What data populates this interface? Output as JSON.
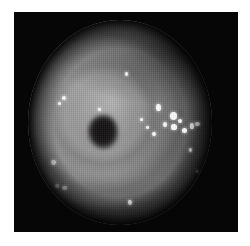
{
  "image": {
    "kind": "endoscopy-photograph",
    "modality_label": "",
    "caption": "",
    "page_background": "#ffffff",
    "frame": {
      "background": "#060606",
      "x": 14,
      "y": 12,
      "width": 224,
      "height": 220
    },
    "field_of_view": {
      "shape": "circle",
      "x": 28,
      "y": 20,
      "width": 184,
      "height": 205,
      "rim_color": "#0a0a0a"
    },
    "tissue": {
      "palette": {
        "highlight": "#b2b2b2",
        "bright": "#a3a3a3",
        "mid": "#8a8a8a",
        "shadow": "#565656",
        "deep_shadow": "#1d1d1d",
        "lumen": "#151313",
        "specular": "#fbfbfb"
      },
      "fold_count": 4,
      "fold_pattern": "concentric-haustral"
    },
    "lumen": {
      "label": "dark-lumen-opening",
      "x": 88,
      "y": 115,
      "width": 30,
      "height": 34
    },
    "notch": {
      "label": "right-edge-occlusion",
      "x": 210,
      "y": 98,
      "width": 26,
      "height": 42
    },
    "specular_highlights": [
      {
        "x": 156,
        "y": 104,
        "w": 5,
        "h": 7
      },
      {
        "x": 170,
        "y": 112,
        "w": 7,
        "h": 8
      },
      {
        "x": 163,
        "y": 122,
        "w": 4,
        "h": 5
      },
      {
        "x": 171,
        "y": 124,
        "w": 6,
        "h": 6
      },
      {
        "x": 178,
        "y": 119,
        "w": 4,
        "h": 4
      },
      {
        "x": 182,
        "y": 128,
        "w": 5,
        "h": 5
      },
      {
        "x": 190,
        "y": 123,
        "w": 4,
        "h": 6
      },
      {
        "x": 195,
        "y": 122,
        "w": 5,
        "h": 4
      },
      {
        "x": 152,
        "y": 132,
        "w": 4,
        "h": 4
      },
      {
        "x": 146,
        "y": 126,
        "w": 3,
        "h": 3
      },
      {
        "x": 140,
        "y": 118,
        "w": 3,
        "h": 3
      },
      {
        "x": 125,
        "y": 72,
        "w": 3,
        "h": 4
      },
      {
        "x": 98,
        "y": 108,
        "w": 3,
        "h": 3
      },
      {
        "x": 62,
        "y": 96,
        "w": 4,
        "h": 4
      },
      {
        "x": 58,
        "y": 102,
        "w": 3,
        "h": 3
      },
      {
        "x": 51,
        "y": 160,
        "w": 5,
        "h": 5
      },
      {
        "x": 55,
        "y": 184,
        "w": 4,
        "h": 4
      },
      {
        "x": 62,
        "y": 186,
        "w": 5,
        "h": 4
      },
      {
        "x": 128,
        "y": 200,
        "w": 4,
        "h": 5
      },
      {
        "x": 189,
        "y": 148,
        "w": 3,
        "h": 4
      },
      {
        "x": 196,
        "y": 170,
        "w": 3,
        "h": 3
      }
    ]
  }
}
